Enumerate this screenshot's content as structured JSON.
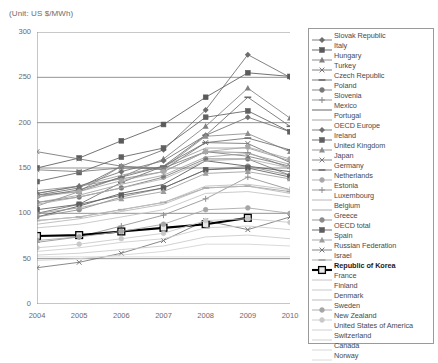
{
  "unit_label": "(Unit: US $/MWh)",
  "axis": {
    "yticks": [
      "300",
      "250",
      "200",
      "150",
      "100",
      "50",
      "0"
    ],
    "xticks": [
      "2004",
      "2005",
      "2006",
      "2007",
      "2008",
      "2009",
      "2010"
    ]
  },
  "legend": {
    "items": [
      {
        "label": "Slovak Republic",
        "marker": "diamond",
        "color": "#6d6d6d",
        "highlight": false
      },
      {
        "label": "Italy",
        "marker": "square",
        "color": "#5a5a5a",
        "highlight": false
      },
      {
        "label": "Hungary",
        "marker": "triangle",
        "color": "#808080",
        "highlight": false
      },
      {
        "label": "Turkey",
        "marker": "x",
        "color": "#737373",
        "highlight": false
      },
      {
        "label": "Czech Republic",
        "marker": "dash",
        "color": "#6b6b6b",
        "highlight": false
      },
      {
        "label": "Poland",
        "marker": "circle",
        "color": "#787878",
        "highlight": false
      },
      {
        "label": "Slovenia",
        "marker": "plus",
        "color": "#8a8a8a",
        "highlight": false
      },
      {
        "label": "Mexico",
        "marker": "none",
        "color": "#555555",
        "highlight": false
      },
      {
        "label": "Portugal",
        "marker": "none",
        "color": "#9a9a9a",
        "highlight": false
      },
      {
        "label": "OECD Europe",
        "marker": "diamond",
        "color": "#707070",
        "highlight": false
      },
      {
        "label": "Ireland",
        "marker": "square",
        "color": "#606060",
        "highlight": false
      },
      {
        "label": "United Kingdom",
        "marker": "triangle",
        "color": "#8d8d8d",
        "highlight": false
      },
      {
        "label": "Japan",
        "marker": "x",
        "color": "#7a7a7a",
        "highlight": false
      },
      {
        "label": "Germany",
        "marker": "dash",
        "color": "#6f6f6f",
        "highlight": false
      },
      {
        "label": "Netherlands",
        "marker": "circle",
        "color": "#a8a8a8",
        "highlight": false
      },
      {
        "label": "Estonia",
        "marker": "plus",
        "color": "#909090",
        "highlight": false
      },
      {
        "label": "Luxembourg",
        "marker": "none",
        "color": "#b0b0b0",
        "highlight": false
      },
      {
        "label": "Belgium",
        "marker": "none",
        "color": "#a0a0a0",
        "highlight": false
      },
      {
        "label": "Greece",
        "marker": "circle",
        "color": "#8b8b8b",
        "highlight": false
      },
      {
        "label": "OECD total",
        "marker": "square",
        "color": "#5e5e5e",
        "highlight": false
      },
      {
        "label": "Spain",
        "marker": "triangle",
        "color": "#9d9d9d",
        "highlight": false
      },
      {
        "label": "Russian Federation",
        "marker": "x",
        "color": "#747474",
        "highlight": false
      },
      {
        "label": "Israel",
        "marker": "dash",
        "color": "#9f9f9f",
        "highlight": false
      },
      {
        "label": "Republic of Korea",
        "marker": "opensquare",
        "color": "#000000",
        "highlight": true
      },
      {
        "label": "France",
        "marker": "none",
        "color": "#bdbdbd",
        "highlight": false
      },
      {
        "label": "Finland",
        "marker": "none",
        "color": "#c2c2c2",
        "highlight": false
      },
      {
        "label": "Denmark",
        "marker": "none",
        "color": "#b6b6b6",
        "highlight": false
      },
      {
        "label": "Sweden",
        "marker": "circle",
        "color": "#a5a5a5",
        "highlight": false
      },
      {
        "label": "New Zealand",
        "marker": "circle",
        "color": "#c8c8c8",
        "highlight": false
      },
      {
        "label": "United States of America",
        "marker": "none",
        "color": "#cccccc",
        "highlight": false
      },
      {
        "label": "Switzerland",
        "marker": "none",
        "color": "#c9c9c9",
        "highlight": false
      },
      {
        "label": "Canada",
        "marker": "none",
        "color": "#d2d2d2",
        "highlight": false
      },
      {
        "label": "Norway",
        "marker": "none",
        "color": "#d6d6d6",
        "highlight": false
      }
    ]
  },
  "chart_data": {
    "type": "line",
    "title": "",
    "xlabel": "",
    "ylabel": "US $/MWh",
    "x": [
      2004,
      2005,
      2006,
      2007,
      2008,
      2009,
      2010
    ],
    "xlim": [
      2004,
      2010
    ],
    "ylim": [
      0,
      300
    ],
    "ytick_step": 50,
    "grid": true,
    "legend_position": "right",
    "series": [
      {
        "name": "Slovak Republic",
        "marker": "diamond",
        "color": "#6d6d6d",
        "values": [
          120,
          128,
          152,
          170,
          214,
          275,
          250
        ]
      },
      {
        "name": "Italy",
        "marker": "square",
        "color": "#5a5a5a",
        "values": [
          150,
          161,
          180,
          198,
          228,
          255,
          251
        ]
      },
      {
        "name": "Hungary",
        "marker": "triangle",
        "color": "#808080",
        "values": [
          120,
          124,
          140,
          160,
          196,
          238,
          205
        ]
      },
      {
        "name": "Turkey",
        "marker": "x",
        "color": "#737373",
        "values": [
          168,
          160,
          152,
          148,
          178,
          177,
          156
        ]
      },
      {
        "name": "Czech Republic",
        "marker": "dash",
        "color": "#6b6b6b",
        "values": [
          100,
          110,
          134,
          152,
          186,
          228,
          196
        ]
      },
      {
        "name": "Poland",
        "marker": "circle",
        "color": "#787878",
        "values": [
          112,
          118,
          128,
          140,
          160,
          160,
          142
        ]
      },
      {
        "name": "Slovenia",
        "marker": "plus",
        "color": "#8a8a8a",
        "values": [
          125,
          130,
          138,
          146,
          168,
          167,
          150
        ]
      },
      {
        "name": "Mexico",
        "marker": "none",
        "color": "#555555",
        "values": [
          96,
          108,
          122,
          132,
          158,
          152,
          146
        ]
      },
      {
        "name": "Portugal",
        "marker": "none",
        "color": "#9a9a9a",
        "values": [
          122,
          130,
          142,
          152,
          172,
          172,
          158
        ]
      },
      {
        "name": "OECD Europe",
        "marker": "diamond",
        "color": "#707070",
        "values": [
          122,
          130,
          146,
          158,
          186,
          206,
          190
        ]
      },
      {
        "name": "Ireland",
        "marker": "square",
        "color": "#606060",
        "values": [
          135,
          145,
          162,
          172,
          206,
          213,
          190
        ]
      },
      {
        "name": "United Kingdom",
        "marker": "triangle",
        "color": "#8d8d8d",
        "values": [
          108,
          124,
          152,
          150,
          185,
          188,
          168
        ]
      },
      {
        "name": "Japan",
        "marker": "x",
        "color": "#7a7a7a",
        "values": [
          148,
          146,
          150,
          150,
          168,
          163,
          152
        ]
      },
      {
        "name": "Germany",
        "marker": "dash",
        "color": "#6f6f6f",
        "values": [
          118,
          126,
          140,
          152,
          178,
          183,
          170
        ]
      },
      {
        "name": "Netherlands",
        "marker": "circle",
        "color": "#a8a8a8",
        "values": [
          118,
          124,
          136,
          146,
          168,
          173,
          160
        ]
      },
      {
        "name": "Estonia",
        "marker": "plus",
        "color": "#909090",
        "values": [
          68,
          74,
          86,
          98,
          116,
          140,
          126
        ]
      },
      {
        "name": "Luxembourg",
        "marker": "none",
        "color": "#b0b0b0",
        "values": [
          110,
          118,
          128,
          138,
          158,
          160,
          150
        ]
      },
      {
        "name": "Belgium",
        "marker": "none",
        "color": "#a0a0a0",
        "values": [
          112,
          120,
          132,
          142,
          162,
          166,
          154
        ]
      },
      {
        "name": "Greece",
        "marker": "circle",
        "color": "#8b8b8b",
        "values": [
          96,
          104,
          118,
          128,
          148,
          152,
          142
        ]
      },
      {
        "name": "OECD total",
        "marker": "square",
        "color": "#5e5e5e",
        "values": [
          104,
          110,
          120,
          128,
          148,
          150,
          140
        ]
      },
      {
        "name": "Spain",
        "marker": "triangle",
        "color": "#9d9d9d",
        "values": [
          100,
          106,
          116,
          124,
          144,
          146,
          138
        ]
      },
      {
        "name": "Russian Federation",
        "marker": "x",
        "color": "#747474",
        "values": [
          40,
          46,
          56,
          70,
          92,
          82,
          96
        ]
      },
      {
        "name": "Israel",
        "marker": "dash",
        "color": "#9f9f9f",
        "values": [
          92,
          96,
          104,
          112,
          128,
          130,
          124
        ]
      },
      {
        "name": "Republic of Korea",
        "marker": "opensquare",
        "color": "#000000",
        "values": [
          75,
          76,
          80,
          84,
          88,
          95,
          null
        ]
      },
      {
        "name": "France",
        "marker": "none",
        "color": "#bdbdbd",
        "values": [
          92,
          96,
          104,
          112,
          130,
          132,
          126
        ]
      },
      {
        "name": "Finland",
        "marker": "none",
        "color": "#c2c2c2",
        "values": [
          84,
          88,
          96,
          104,
          122,
          124,
          118
        ]
      },
      {
        "name": "Denmark",
        "marker": "none",
        "color": "#b6b6b6",
        "values": [
          88,
          94,
          102,
          110,
          128,
          130,
          122
        ]
      },
      {
        "name": "Sweden",
        "marker": "circle",
        "color": "#a5a5a5",
        "values": [
          70,
          74,
          80,
          88,
          104,
          106,
          100
        ]
      },
      {
        "name": "New Zealand",
        "marker": "circle",
        "color": "#c8c8c8",
        "values": [
          62,
          66,
          72,
          78,
          92,
          94,
          90
        ]
      },
      {
        "name": "United States of America",
        "marker": "none",
        "color": "#cccccc",
        "values": [
          58,
          62,
          68,
          72,
          84,
          86,
          82
        ]
      },
      {
        "name": "Switzerland",
        "marker": "none",
        "color": "#c9c9c9",
        "values": [
          54,
          56,
          60,
          64,
          74,
          76,
          72
        ]
      },
      {
        "name": "Canada",
        "marker": "none",
        "color": "#d2d2d2",
        "values": [
          48,
          50,
          54,
          58,
          66,
          66,
          64
        ]
      },
      {
        "name": "Norway",
        "marker": "none",
        "color": "#d6d6d6",
        "values": [
          52,
          52,
          52,
          52,
          52,
          52,
          52
        ]
      }
    ]
  }
}
